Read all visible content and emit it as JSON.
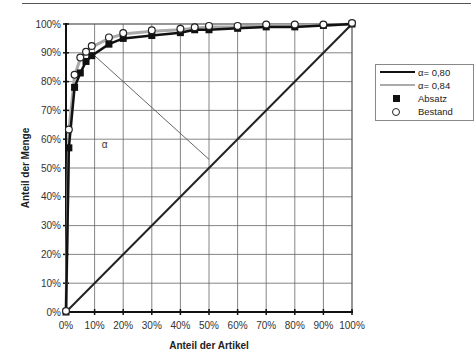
{
  "chart_data": {
    "type": "line",
    "title": "",
    "xlabel": "Anteil der Artikel",
    "ylabel": "Anteil der Menge",
    "xlim": [
      0,
      100
    ],
    "ylim": [
      0,
      100
    ],
    "grid": true,
    "legend_position": "right",
    "x_tick_labels": [
      "0%",
      "10%",
      "20%",
      "30%",
      "40%",
      "50%",
      "60%",
      "70%",
      "80%",
      "90%",
      "100%"
    ],
    "y_tick_labels": [
      "0%",
      "10%",
      "20%",
      "30%",
      "40%",
      "50%",
      "60%",
      "70%",
      "80%",
      "90%",
      "100%"
    ],
    "series": [
      {
        "name": "α= 0,80",
        "style": "solid-black-line",
        "x": [
          0,
          1,
          3,
          5,
          7,
          9,
          15,
          20,
          30,
          40,
          45,
          50,
          60,
          70,
          80,
          90,
          100
        ],
        "y": [
          0,
          57,
          78,
          83,
          87,
          89,
          93,
          95,
          96,
          97,
          98,
          98,
          98.5,
          99,
          99,
          99.5,
          100
        ]
      },
      {
        "name": "α= 0,84",
        "style": "grey-line",
        "x": [
          0,
          1,
          3,
          5,
          7,
          9,
          15,
          20,
          30,
          40,
          45,
          50,
          60,
          70,
          80,
          90,
          100
        ],
        "y": [
          0,
          63,
          82,
          88,
          90,
          92,
          95,
          96.5,
          97.5,
          98,
          98.5,
          99,
          99,
          99.5,
          99.5,
          99.5,
          100
        ]
      },
      {
        "name": "Absatz",
        "style": "filled-square-marker",
        "x": [
          0,
          1,
          3,
          5,
          7,
          9,
          15,
          20,
          30,
          40,
          45,
          50,
          60,
          70,
          80,
          90,
          100
        ],
        "y": [
          0,
          57,
          78,
          83,
          87,
          89,
          93,
          95,
          96,
          97,
          98,
          98,
          98.5,
          99,
          99,
          99.5,
          100
        ]
      },
      {
        "name": "Bestand",
        "style": "open-circle-marker",
        "x": [
          0,
          1,
          3,
          5,
          7,
          9,
          15,
          20,
          30,
          40,
          45,
          50,
          60,
          70,
          80,
          90,
          100
        ],
        "y": [
          0,
          63,
          82,
          88,
          90,
          92,
          95,
          96.5,
          97.5,
          98,
          98.5,
          99,
          99,
          99.5,
          99.5,
          99.5,
          100
        ]
      },
      {
        "name": "diagonal",
        "style": "solid-black-line",
        "x": [
          0,
          100
        ],
        "y": [
          0,
          100
        ]
      }
    ],
    "annotations": [
      {
        "text": "α",
        "x": 7.5,
        "y": 59
      },
      {
        "type": "line",
        "from": [
          10,
          89
        ],
        "to": [
          50,
          53
        ],
        "note": "tangent-to-diagonal reference line"
      }
    ]
  },
  "legend": {
    "items": [
      {
        "label": "α= 0,80"
      },
      {
        "label": "α= 0,84"
      },
      {
        "label": "Absatz"
      },
      {
        "label": "Bestand"
      }
    ]
  },
  "annotation_alpha": "α",
  "axis": {
    "x_title": "Anteil der Artikel",
    "y_title": "Anteil der Menge"
  }
}
